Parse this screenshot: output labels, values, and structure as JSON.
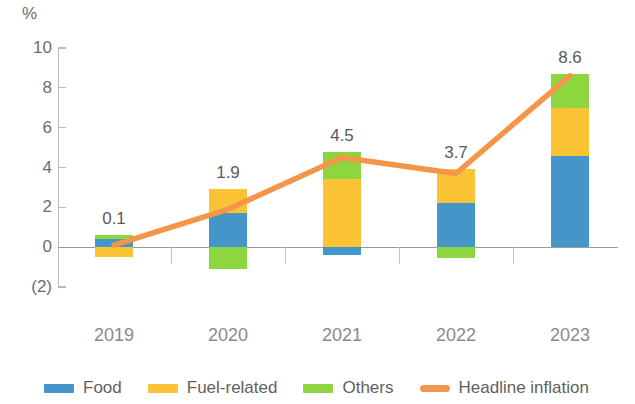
{
  "chart_data": {
    "type": "bar",
    "title": "",
    "subtitle": "",
    "xlabel": "",
    "ylabel": "%",
    "unit_label": "%",
    "categories": [
      "2019",
      "2020",
      "2021",
      "2022",
      "2023"
    ],
    "ylim": [
      -2,
      10
    ],
    "ytick_labels": [
      "10",
      "8",
      "6",
      "4",
      "2",
      "0",
      "(2)"
    ],
    "ytick_values": [
      10,
      8,
      6,
      4,
      2,
      0,
      -2
    ],
    "grid": false,
    "stacked": true,
    "legend_position": "bottom",
    "series": [
      {
        "name": "Food",
        "type": "bar",
        "color": "#4596c8",
        "values": [
          0.4,
          1.7,
          -0.4,
          2.2,
          4.6
        ]
      },
      {
        "name": "Fuel-related",
        "type": "bar",
        "color": "#fbc334",
        "values": [
          -0.5,
          1.2,
          3.4,
          1.7,
          2.4
        ]
      },
      {
        "name": "Others",
        "type": "bar",
        "color": "#8ed63f",
        "values": [
          0.2,
          -1.1,
          1.4,
          -0.55,
          1.7
        ]
      },
      {
        "name": "Headline inflation",
        "type": "line",
        "color": "#f5954a",
        "values": [
          0.1,
          1.9,
          4.5,
          3.7,
          8.6
        ]
      }
    ],
    "data_labels": [
      "0.1",
      "1.9",
      "4.5",
      "3.7",
      "8.6"
    ]
  },
  "legend": {
    "items": [
      {
        "label": "Food",
        "color": "#4596c8",
        "marker": "swatch"
      },
      {
        "label": "Fuel-related",
        "color": "#fbc334",
        "marker": "swatch"
      },
      {
        "label": "Others",
        "color": "#8ed63f",
        "marker": "swatch"
      },
      {
        "label": "Headline inflation",
        "color": "#f5954a",
        "marker": "line"
      }
    ]
  },
  "colors": {
    "food": "#4596c8",
    "fuel": "#fbc334",
    "others": "#8ed63f",
    "headline": "#f5954a",
    "axis": "#b9b9b9",
    "text": "#6d6d6d"
  }
}
